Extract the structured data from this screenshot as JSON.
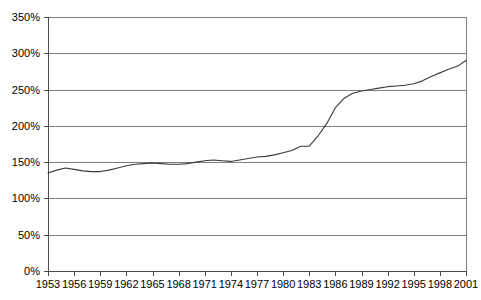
{
  "chart_data": {
    "type": "line",
    "title": "",
    "subtitle": "",
    "xlabel": "",
    "ylabel": "",
    "xlim": [
      1953,
      2001
    ],
    "ylim": [
      0,
      350
    ],
    "grid": true,
    "grid_axis": "y",
    "legend": false,
    "legend_position": "none",
    "y_tick_labels": [
      "0%",
      "50%",
      "100%",
      "150%",
      "200%",
      "250%",
      "300%",
      "350%"
    ],
    "y_tick_values": [
      0,
      50,
      100,
      150,
      200,
      250,
      300,
      350
    ],
    "x_tick_labels": [
      "1953",
      "1956",
      "1959",
      "1962",
      "1965",
      "1968",
      "1971",
      "1974",
      "1977",
      "1980",
      "1983",
      "1986",
      "1989",
      "1992",
      "1995",
      "1998",
      "2001"
    ],
    "x_tick_values": [
      1953,
      1956,
      1959,
      1962,
      1965,
      1968,
      1971,
      1974,
      1977,
      1980,
      1983,
      1986,
      1989,
      1992,
      1995,
      1998,
      2001
    ],
    "line_color": "#3a3a3a",
    "grid_color": "#7f7f7f",
    "axis_color": "#4d4d4d",
    "background_color": "#ffffff",
    "series": [
      {
        "name": "Series 1",
        "x": [
          1953,
          1954,
          1955,
          1956,
          1957,
          1958,
          1959,
          1960,
          1961,
          1962,
          1963,
          1964,
          1965,
          1966,
          1967,
          1968,
          1969,
          1970,
          1971,
          1972,
          1973,
          1974,
          1975,
          1976,
          1977,
          1978,
          1979,
          1980,
          1981,
          1982,
          1983,
          1984,
          1985,
          1986,
          1987,
          1988,
          1989,
          1990,
          1991,
          1992,
          1993,
          1994,
          1995,
          1996,
          1997,
          1998,
          1999,
          2000,
          2001
        ],
        "values": [
          135,
          139,
          142,
          140,
          138,
          137,
          137,
          139,
          142,
          145,
          147,
          148,
          149,
          148,
          147,
          147,
          148,
          150,
          152,
          153,
          152,
          151,
          153,
          155,
          157,
          158,
          160,
          163,
          166,
          172,
          172,
          186,
          203,
          225,
          238,
          245,
          248,
          250,
          252,
          254,
          255,
          256,
          258,
          262,
          268,
          273,
          278,
          282,
          290
        ]
      }
    ]
  },
  "geometry": {
    "plot_left": 48,
    "plot_right": 466,
    "plot_top": 17,
    "plot_bottom": 271
  }
}
